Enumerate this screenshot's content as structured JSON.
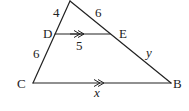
{
  "diagram": {
    "type": "triangle-with-parallel-segment",
    "background": "#ffffff",
    "line_color": "#222222",
    "points": {
      "A": {
        "label": "",
        "x": 70,
        "y": 1
      },
      "D": {
        "label": "D",
        "x": 55,
        "y": 34
      },
      "E": {
        "label": "E",
        "x": 110,
        "y": 34
      },
      "C": {
        "label": "C",
        "x": 33,
        "y": 83
      },
      "B": {
        "label": "B",
        "x": 171,
        "y": 83
      }
    },
    "segment_labels": {
      "AD": "4",
      "AE": "6",
      "DE": "5",
      "DC": "6",
      "EB": "y",
      "CB": "x"
    },
    "parallel_marks": {
      "DE": ">>",
      "CB": ">>"
    }
  }
}
